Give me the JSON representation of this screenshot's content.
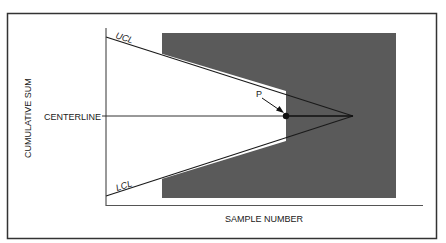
{
  "diagram": {
    "labels": {
      "ucl": "UCL",
      "lcl": "LCL",
      "centerline": "CENTERLINE",
      "y_axis": "CUMULATIVE SUM",
      "x_axis": "SAMPLE NUMBER",
      "point": "P"
    },
    "colors": {
      "shaded_region": "#5a5a5a",
      "lines": "#1a1a1a",
      "background": "#ffffff",
      "frame": "#333333"
    }
  }
}
